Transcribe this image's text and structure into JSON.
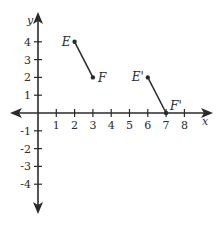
{
  "diagram": {
    "type": "coordinate-plane-translation",
    "axes": {
      "x_label": "x",
      "y_label": "y",
      "x_ticks": [
        1,
        2,
        3,
        4,
        5,
        6,
        7,
        8
      ],
      "y_ticks": [
        4,
        3,
        2,
        1,
        -1,
        -2,
        -3,
        -4
      ],
      "x_range": [
        -1.5,
        9.7
      ],
      "y_range": [
        -5.6,
        5.6
      ]
    },
    "segments": [
      {
        "name": "EF",
        "start": {
          "label": "E",
          "x": 2,
          "y": 4
        },
        "end": {
          "label": "F",
          "x": 3,
          "y": 2
        }
      },
      {
        "name": "E'F'",
        "start": {
          "label": "E'",
          "x": 6,
          "y": 2
        },
        "end": {
          "label": "F'",
          "x": 7,
          "y": 0
        }
      }
    ],
    "colors": {
      "stroke": "#2a2a2a",
      "background": "#ffffff"
    }
  }
}
